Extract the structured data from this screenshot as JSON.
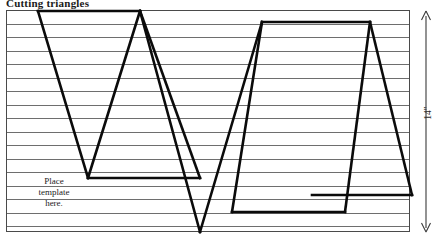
{
  "page": {
    "title_clipped": "Cutting triangles",
    "background": "#ffffff",
    "ink_color": "#000000",
    "rule_color": "#6e6e6e",
    "width": 444,
    "height": 236
  },
  "diagram": {
    "type": "cutting-layout",
    "panel": {
      "x": 6,
      "y": 10,
      "width": 404,
      "height": 222,
      "border_color": "#4a4a4a"
    },
    "ruled_lines": {
      "count": 16,
      "spacing": 13.6,
      "first_y": 24,
      "color": "#6e6e6e"
    },
    "template_outline_width": 2.6,
    "template_outline_color": "#0b0b0b",
    "paths": [
      "M38,11 L140,11 L140,11",
      "M38,11 L88,178",
      "M88,178 L140,11",
      "M88,178 L200,178",
      "M200,178 L140,11",
      "M140,11 L200,232",
      "M200,232 L262,22",
      "M262,22 L370,22",
      "M262,22 L232,212",
      "M232,212 L345,212",
      "M345,212 L370,22",
      "M370,22 L412,195",
      "M412,195 L312,195"
    ]
  },
  "annotations": {
    "template_note": {
      "line1": "Place",
      "line2": "template",
      "line3": "here."
    },
    "dimension": {
      "label": "14\"",
      "orientation": "vertical",
      "arrow": "double-headed"
    }
  }
}
